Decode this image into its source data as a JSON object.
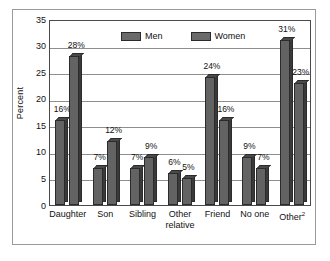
{
  "chart_data": {
    "type": "bar",
    "title": "",
    "subtitle": "",
    "xlabel": "",
    "ylabel": "Percent",
    "ylim": [
      0,
      35
    ],
    "ytick_step": 5,
    "yticks": [
      "35",
      "30",
      "25",
      "20",
      "15",
      "10",
      "5",
      "0"
    ],
    "grid": true,
    "grid_axis": "y",
    "legend_position": "top-center",
    "categories": [
      "Daughter",
      "Son",
      "Sibling",
      "Other relative",
      "Friend",
      "No one",
      "Other"
    ],
    "category_labels": [
      {
        "line1": "Daughter",
        "line2": "",
        "superscript": ""
      },
      {
        "line1": "Son",
        "line2": "",
        "superscript": ""
      },
      {
        "line1": "Sibling",
        "line2": "",
        "superscript": ""
      },
      {
        "line1": "Other",
        "line2": "relative",
        "superscript": ""
      },
      {
        "line1": "Friend",
        "line2": "",
        "superscript": ""
      },
      {
        "line1": "No one",
        "line2": "",
        "superscript": ""
      },
      {
        "line1": "Other",
        "line2": "",
        "superscript": "2"
      }
    ],
    "series": [
      {
        "name": "Men",
        "color": "#636363",
        "values": [
          16,
          7,
          7,
          6,
          24,
          9,
          31
        ],
        "data_labels": [
          "16%",
          "7%",
          "7%",
          "6%",
          "24%",
          "9%",
          "31%"
        ]
      },
      {
        "name": "Women",
        "color": "#636363",
        "values": [
          28,
          12,
          9,
          5,
          16,
          7,
          23
        ],
        "data_labels": [
          "28%",
          "12%",
          "9%",
          "5%",
          "16%",
          "7%",
          "23%"
        ]
      }
    ]
  },
  "legend": {
    "items": [
      {
        "label": "Men",
        "color": "#6a6a6a"
      },
      {
        "label": "Women",
        "color": "#6a6a6a"
      }
    ]
  },
  "colors": {
    "bar_face": "#636363",
    "bar_side": "#3a3a3a",
    "bar_outline": "#2b2b2b",
    "gridline": "#8e8e8e",
    "axis": "#4a4a4a",
    "frame": "#9a9a9a",
    "text": "#111111",
    "background": "#ffffff"
  }
}
